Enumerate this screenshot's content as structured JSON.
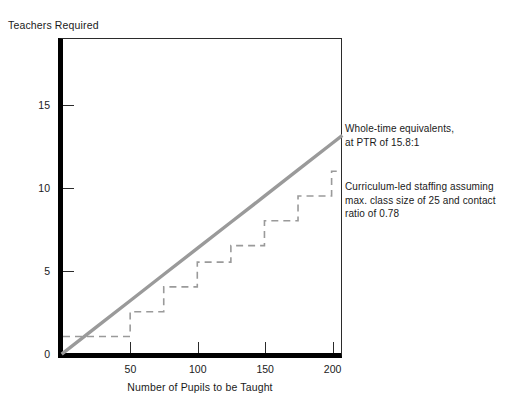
{
  "top_caption": "",
  "axes": {
    "y_title": "Teachers Required",
    "x_title": "Number of Pupils to be Taught",
    "y_ticks": [
      0,
      5,
      10,
      15
    ],
    "x_ticks": [
      50,
      100,
      150,
      200
    ]
  },
  "annotations": {
    "wte": {
      "line1": "Whole-time equivalents,",
      "line2": "at PTR of 15.8:1"
    },
    "curriculum": {
      "line1": "Curriculum-led staffing assuming",
      "line2": "max. class size of 25 and contact",
      "line3": "ratio of 0.78"
    }
  },
  "colors": {
    "solid_line": "#9a9a9a",
    "dashed_line": "#9a9a9a",
    "axis": "#000000",
    "frame": "#2b2b2b",
    "text": "#1a1a1a"
  },
  "chart_data": {
    "type": "line",
    "title": "",
    "xlabel": "Number of Pupils to be Taught",
    "ylabel": "Teachers Required",
    "xlim": [
      0,
      207
    ],
    "ylim": [
      0,
      19
    ],
    "grid": false,
    "legend": "right-annotations",
    "series": [
      {
        "name": "Whole-time equivalents, at PTR of 15.8:1",
        "style": "solid",
        "color": "#9a9a9a",
        "relation": "y = x / 15.8",
        "x": [
          0,
          25,
          50,
          75,
          100,
          125,
          150,
          175,
          200,
          207
        ],
        "y": [
          0,
          1.58,
          3.16,
          4.75,
          6.33,
          7.91,
          9.49,
          11.08,
          12.66,
          13.1
        ]
      },
      {
        "name": "Curriculum-led staffing assuming max. class size of 25 and contact ratio of 0.78",
        "style": "dashed",
        "color": "#9a9a9a",
        "relation": "step: ceil(x/25) classes / 0.78 contact ratio",
        "step_x": [
          0,
          25,
          50,
          75,
          100,
          125,
          150,
          175,
          200,
          207
        ],
        "step_y": [
          1,
          1,
          2.5,
          4,
          5.5,
          6.5,
          8,
          9.5,
          11,
          11
        ]
      }
    ]
  }
}
